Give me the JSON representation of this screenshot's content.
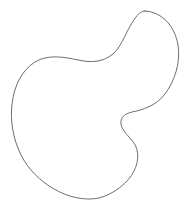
{
  "canvas": {
    "width": 189,
    "height": 208,
    "background_color": "#ffffff",
    "alt_text": "Closed freeform blob outline"
  },
  "figure": {
    "name": "blob-outline",
    "type": "closed-freeform-curve",
    "stroke_color": "#6e6e6e",
    "stroke_width": 1,
    "fill_color": "none",
    "path": "M 145 11 C 163 12 175 27 178 45 C 181 63 174 82 165 94 C 156 106 142 110 132 112 C 124 114 120 118 121 124 C 122 131 129 136 134 143 C 139 151 139 161 134 171 C 128 183 114 194 99 198 C 84 201 68 197 54 189 C 40 181 28 169 21 155 C 13 139 10 120 12 104 C 14 86 22 70 35 62 C 48 54 64 57 78 60 C 92 63 103 62 113 54 C 123 45 127 28 136 17 C 139 13 142 11 145 11 Z",
    "landmarks": [
      {
        "name": "top-peak",
        "x": 145,
        "y": 11
      },
      {
        "name": "rightmost",
        "x": 178,
        "y": 47
      },
      {
        "name": "concave-notch",
        "x": 121,
        "y": 122
      },
      {
        "name": "lower-right-lobe",
        "x": 138,
        "y": 157
      },
      {
        "name": "bottom",
        "x": 97,
        "y": 198
      },
      {
        "name": "leftmost",
        "x": 12,
        "y": 103
      },
      {
        "name": "upper-left-saddle",
        "x": 72,
        "y": 60
      }
    ]
  }
}
